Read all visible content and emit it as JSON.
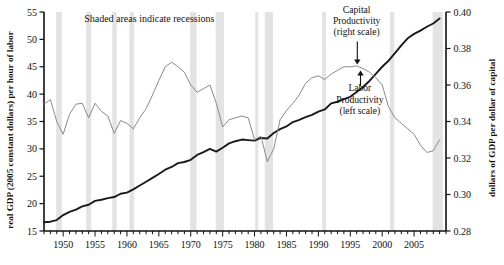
{
  "chart_data": {
    "type": "line",
    "title": "",
    "xlabel": "",
    "ylabel": "real GDP (2005 constant dollars) per hour of labor",
    "y2label": "dollars of GDP per dollar of capital",
    "xlim": [
      1947,
      2010
    ],
    "ylim": [
      15,
      55
    ],
    "y2lim": [
      0.28,
      0.4
    ],
    "grid": false,
    "legend_position": "inline annotations",
    "x_ticks": [
      1950,
      1955,
      1960,
      1965,
      1970,
      1975,
      1980,
      1985,
      1990,
      1995,
      2000,
      2005
    ],
    "x_minor_tick_interval": 1,
    "y_ticks": [
      15,
      20,
      25,
      30,
      35,
      40,
      45,
      50,
      55
    ],
    "y2_ticks": [
      "0.28",
      "0.30",
      "0.32",
      "0.34",
      "0.36",
      "0.38",
      "0.40"
    ],
    "series": [
      {
        "name": "Labor Productivity",
        "scale": "left",
        "color": "#1a1a1a",
        "x": [
          1947,
          1948,
          1949,
          1950,
          1951,
          1952,
          1953,
          1954,
          1955,
          1956,
          1957,
          1958,
          1959,
          1960,
          1961,
          1962,
          1963,
          1964,
          1965,
          1966,
          1967,
          1968,
          1969,
          1970,
          1971,
          1972,
          1973,
          1974,
          1975,
          1976,
          1977,
          1978,
          1979,
          1980,
          1981,
          1982,
          1983,
          1984,
          1985,
          1986,
          1987,
          1988,
          1989,
          1990,
          1991,
          1992,
          1993,
          1994,
          1995,
          1996,
          1997,
          1998,
          1999,
          2000,
          2001,
          2002,
          2003,
          2004,
          2005,
          2006,
          2007,
          2008,
          2009
        ],
        "values": [
          16.6,
          16.7,
          17.0,
          17.9,
          18.5,
          18.9,
          19.5,
          19.8,
          20.5,
          20.7,
          21.0,
          21.2,
          21.8,
          22.0,
          22.6,
          23.3,
          24.0,
          24.7,
          25.4,
          26.2,
          26.7,
          27.4,
          27.6,
          28.0,
          28.9,
          29.4,
          30.0,
          29.5,
          30.2,
          31.0,
          31.4,
          31.7,
          31.6,
          31.5,
          32.0,
          31.9,
          32.9,
          33.6,
          34.1,
          34.9,
          35.3,
          35.8,
          36.2,
          36.8,
          37.2,
          38.3,
          38.6,
          39.1,
          39.5,
          40.4,
          41.3,
          42.4,
          43.7,
          45.0,
          46.1,
          47.5,
          48.9,
          50.2,
          51.0,
          51.6,
          52.3,
          52.9,
          53.8
        ]
      },
      {
        "name": "Capital Productivity",
        "scale": "right",
        "color": "#8a8a8a",
        "x": [
          1947,
          1948,
          1949,
          1950,
          1951,
          1952,
          1953,
          1954,
          1955,
          1956,
          1957,
          1958,
          1959,
          1960,
          1961,
          1962,
          1963,
          1964,
          1965,
          1966,
          1967,
          1968,
          1969,
          1970,
          1971,
          1972,
          1973,
          1974,
          1975,
          1976,
          1977,
          1978,
          1979,
          1980,
          1981,
          1982,
          1983,
          1984,
          1985,
          1986,
          1987,
          1988,
          1989,
          1990,
          1991,
          1992,
          1993,
          1994,
          1995,
          1996,
          1997,
          1998,
          1999,
          2000,
          2001,
          2002,
          2003,
          2004,
          2005,
          2006,
          2007,
          2008,
          2009
        ],
        "values": [
          0.3495,
          0.352,
          0.34,
          0.333,
          0.344,
          0.3495,
          0.35,
          0.342,
          0.35,
          0.3455,
          0.343,
          0.3335,
          0.3405,
          0.339,
          0.336,
          0.342,
          0.347,
          0.3545,
          0.3625,
          0.37,
          0.3725,
          0.37,
          0.367,
          0.36,
          0.356,
          0.358,
          0.36,
          0.35,
          0.337,
          0.341,
          0.342,
          0.343,
          0.342,
          0.33,
          0.332,
          0.318,
          0.325,
          0.341,
          0.346,
          0.35,
          0.3545,
          0.361,
          0.364,
          0.365,
          0.363,
          0.366,
          0.368,
          0.37,
          0.37,
          0.3705,
          0.369,
          0.367,
          0.364,
          0.36,
          0.348,
          0.342,
          0.339,
          0.336,
          0.333,
          0.327,
          0.323,
          0.324,
          0.33
        ]
      }
    ],
    "recessions": [
      {
        "start": 1948.9,
        "end": 1949.8
      },
      {
        "start": 1953.6,
        "end": 1954.4
      },
      {
        "start": 1957.7,
        "end": 1958.4
      },
      {
        "start": 1960.4,
        "end": 1961.1
      },
      {
        "start": 1969.9,
        "end": 1970.9
      },
      {
        "start": 1973.9,
        "end": 1975.2
      },
      {
        "start": 1980.1,
        "end": 1980.6
      },
      {
        "start": 1981.6,
        "end": 1982.9
      },
      {
        "start": 1990.6,
        "end": 1991.2
      },
      {
        "start": 2001.2,
        "end": 2001.9
      },
      {
        "start": 2007.9,
        "end": 2009.5
      }
    ],
    "recession_color": "#e3e3e3",
    "annotations": [
      {
        "text": "Shaded areas indicate recessions",
        "x": 1963.5,
        "y": 53.1
      },
      {
        "text": "Capital",
        "x": 1996.0,
        "y": 54.8
      },
      {
        "text": "Productivity",
        "x": 1996.0,
        "y": 52.8
      },
      {
        "text": "(right scale)",
        "x": 1996.0,
        "y": 50.8
      },
      {
        "text": "Labor",
        "x": 1996.5,
        "y": 40.5
      },
      {
        "text": "Productivity",
        "x": 1996.5,
        "y": 38.4
      },
      {
        "text": "(left scale)",
        "x": 1996.5,
        "y": 36.3
      }
    ]
  },
  "labels": {
    "shaded_note": "Shaded areas indicate recessions",
    "capital_line1": "Capital",
    "capital_line2": "Productivity",
    "capital_line3": "(right scale)",
    "labor_line1": "Labor",
    "labor_line2": "Productivity",
    "labor_line3": "(left scale)",
    "left_axis_title": "real GDP (2005 constant dollars) per hour of labor",
    "right_axis_title": "dollars of GDP per dollar of capital"
  }
}
